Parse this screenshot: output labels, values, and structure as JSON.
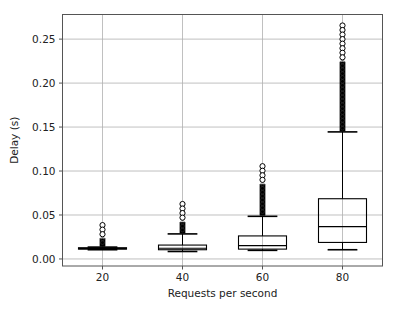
{
  "chart_data": {
    "type": "box",
    "title": "",
    "xlabel": "Requests per second",
    "ylabel": "Delay (s)",
    "categories": [
      "20",
      "40",
      "60",
      "80"
    ],
    "x_tick_labels": [
      "20",
      "40",
      "60",
      "80"
    ],
    "y_tick_labels": [
      "0.00",
      "0.05",
      "0.10",
      "0.15",
      "0.20",
      "0.25"
    ],
    "y_tick_values": [
      0.0,
      0.05,
      0.1,
      0.15,
      0.2,
      0.25
    ],
    "xlim": [
      10,
      90
    ],
    "ylim": [
      -0.008,
      0.278
    ],
    "grid": "horizontal-and-vertical",
    "legend": "none",
    "box_color": "#000000",
    "background_color": "#ffffff",
    "grid_color": "#b0b0b0",
    "boxes": [
      {
        "category": "20",
        "x": 20,
        "whisker_low": 0.0105,
        "q1": 0.0112,
        "median": 0.0118,
        "q3": 0.0128,
        "whisker_high": 0.0135,
        "outlier_min": 0.0142,
        "outlier_max": 0.0385,
        "outlier_density": "dense-column",
        "top_circle_markers": 3
      },
      {
        "category": "40",
        "x": 40,
        "whisker_low": 0.0085,
        "q1": 0.0105,
        "median": 0.0122,
        "q3": 0.0158,
        "whisker_high": 0.0285,
        "outlier_min": 0.0295,
        "outlier_max": 0.0625,
        "outlier_density": "dense-column",
        "top_circle_markers": 4
      },
      {
        "category": "60",
        "x": 60,
        "whisker_low": 0.0098,
        "q1": 0.0112,
        "median": 0.0152,
        "q3": 0.0262,
        "whisker_high": 0.0485,
        "outlier_min": 0.0495,
        "outlier_max": 0.1055,
        "outlier_density": "dense-column",
        "top_circle_markers": 4
      },
      {
        "category": "80",
        "x": 80,
        "whisker_low": 0.0105,
        "q1": 0.0188,
        "median": 0.0368,
        "q3": 0.0685,
        "whisker_high": 0.1445,
        "outlier_min": 0.1455,
        "outlier_max": 0.2655,
        "outlier_density": "dense-column",
        "top_circle_markers": 8
      }
    ]
  }
}
